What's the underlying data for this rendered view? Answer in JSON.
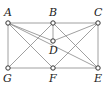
{
  "diagram": {
    "type": "graph",
    "nodes": [
      {
        "id": "A",
        "label": "A",
        "x": 8,
        "y": 23,
        "lx": 4,
        "ly": 16
      },
      {
        "id": "B",
        "label": "B",
        "x": 53,
        "y": 23,
        "lx": 49,
        "ly": 16
      },
      {
        "id": "C",
        "label": "C",
        "x": 98,
        "y": 23,
        "lx": 94,
        "ly": 16
      },
      {
        "id": "D",
        "label": "D",
        "x": 53,
        "y": 41,
        "lx": 49,
        "ly": 54
      },
      {
        "id": "G",
        "label": "G",
        "x": 8,
        "y": 68,
        "lx": 3,
        "ly": 82
      },
      {
        "id": "F",
        "label": "F",
        "x": 53,
        "y": 68,
        "lx": 49,
        "ly": 82
      },
      {
        "id": "E",
        "label": "E",
        "x": 98,
        "y": 68,
        "lx": 94,
        "ly": 82
      }
    ],
    "edges": [
      [
        "A",
        "B"
      ],
      [
        "B",
        "C"
      ],
      [
        "A",
        "G"
      ],
      [
        "C",
        "E"
      ],
      [
        "G",
        "F"
      ],
      [
        "F",
        "E"
      ],
      [
        "B",
        "D"
      ],
      [
        "A",
        "D"
      ],
      [
        "C",
        "D"
      ],
      [
        "A",
        "F"
      ],
      [
        "A",
        "E"
      ],
      [
        "B",
        "G"
      ],
      [
        "B",
        "E"
      ],
      [
        "C",
        "F"
      ]
    ]
  }
}
